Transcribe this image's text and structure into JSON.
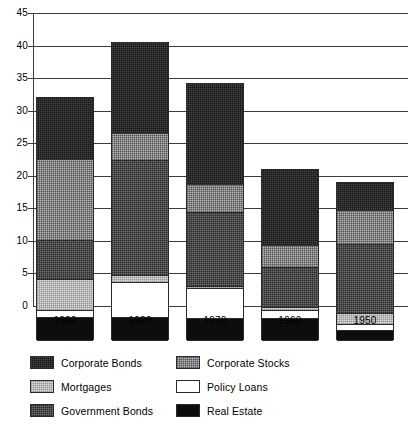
{
  "chart_data": {
    "type": "bar",
    "subtype": "stacked-bar",
    "title": "",
    "xlabel": "",
    "ylabel": "",
    "categories": [
      "1990",
      "1980",
      "1970",
      "1960",
      "1950"
    ],
    "ylim": [
      0,
      45
    ],
    "yticks": [
      0,
      5,
      10,
      15,
      20,
      25,
      30,
      35,
      40,
      45
    ],
    "ytick_labels": [
      "0",
      "5",
      "10",
      "15",
      "20",
      "25",
      "30",
      "35",
      "40",
      "45"
    ],
    "grid": true,
    "grid_axis": "y",
    "legend_position": "bottom",
    "stack_order_bottom_to_top": [
      "Real Estate",
      "Policy Loans",
      "Mortgages",
      "Corporate Stocks",
      "Government Bonds",
      "Corporate Bonds"
    ],
    "series": [
      {
        "name": "Real Estate",
        "color": "#0d0d0d",
        "pattern": "solid-black",
        "values": [
          3.6,
          3.5,
          3.3,
          3.3,
          1.5
        ]
      },
      {
        "name": "Policy Loans",
        "color": "#ffffff",
        "pattern": "solid-white",
        "values": [
          1.0,
          5.4,
          4.7,
          1.3,
          0.9
        ]
      },
      {
        "name": "Mortgages",
        "color": "#d9d9d9",
        "pattern": "light-dither",
        "values": [
          4.7,
          0.0,
          0.2,
          0.4,
          1.7
        ]
      },
      {
        "name": "Corporate Stocks",
        "color": "#b6b6b6",
        "pattern": "medium-dither",
        "values": [
          0.0,
          0.0,
          0.0,
          0.0,
          0.0
        ]
      },
      {
        "name": "Government Bonds",
        "color": "#6e6e6e",
        "pattern": "dark-dither",
        "values": [
          6.1,
          18.6,
          11.4,
          6.2,
          10.7
        ]
      },
      {
        "name": "Corporate Bonds",
        "color": "#151515",
        "pattern": "near-black",
        "values": [
          12.4,
          4.2,
          4.4,
          1.9,
          5.2
        ]
      }
    ],
    "extra_series_note": "Mortgages band also appears above Government Bonds in each stack",
    "upper_mortgages": {
      "name": "Mortgages",
      "values": [
        0.0,
        4.3,
        4.4,
        1.8,
        5.2
      ]
    },
    "totals": [
      37.3,
      45.7,
      39.4,
      26.3,
      24.2
    ]
  },
  "bars": [
    {
      "label": "1990",
      "total": 37.3,
      "segments": [
        {
          "series": "Real Estate",
          "value": 3.6,
          "from": 0.0,
          "to": 3.6
        },
        {
          "series": "Policy Loans",
          "value": 1.0,
          "from": 3.6,
          "to": 4.6
        },
        {
          "series": "Mortgages",
          "value": 4.7,
          "from": 4.6,
          "to": 9.3
        },
        {
          "series": "Government Bonds",
          "value": 6.1,
          "from": 9.3,
          "to": 15.4
        },
        {
          "series": "Corporate Stocks",
          "value": 12.4,
          "from": 15.4,
          "to": 27.8
        },
        {
          "series": "Corporate Bonds",
          "value": 9.5,
          "from": 27.8,
          "to": 37.3
        }
      ]
    },
    {
      "label": "1980",
      "total": 45.7,
      "segments": [
        {
          "series": "Real Estate",
          "value": 3.5,
          "from": 0.0,
          "to": 3.5
        },
        {
          "series": "Policy Loans",
          "value": 5.4,
          "from": 3.5,
          "to": 8.9
        },
        {
          "series": "Mortgages",
          "value": 1.1,
          "from": 8.9,
          "to": 10.0
        },
        {
          "series": "Government Bonds",
          "value": 17.6,
          "from": 10.0,
          "to": 27.6
        },
        {
          "series": "Corporate Stocks",
          "value": 4.2,
          "from": 27.6,
          "to": 31.8
        },
        {
          "series": "Corporate Bonds",
          "value": 13.9,
          "from": 31.8,
          "to": 45.7
        }
      ]
    },
    {
      "label": "1970",
      "total": 39.4,
      "segments": [
        {
          "series": "Real Estate",
          "value": 3.3,
          "from": 0.0,
          "to": 3.3
        },
        {
          "series": "Policy Loans",
          "value": 4.7,
          "from": 3.3,
          "to": 8.0
        },
        {
          "series": "Mortgages",
          "value": 0.3,
          "from": 8.0,
          "to": 8.3
        },
        {
          "series": "Government Bonds",
          "value": 11.3,
          "from": 8.3,
          "to": 19.6
        },
        {
          "series": "Corporate Stocks",
          "value": 4.4,
          "from": 19.6,
          "to": 24.0
        },
        {
          "series": "Corporate Bonds",
          "value": 15.4,
          "from": 24.0,
          "to": 39.4
        }
      ]
    },
    {
      "label": "1960",
      "total": 26.3,
      "segments": [
        {
          "series": "Real Estate",
          "value": 3.3,
          "from": 0.0,
          "to": 3.3
        },
        {
          "series": "Policy Loans",
          "value": 1.3,
          "from": 3.3,
          "to": 4.6
        },
        {
          "series": "Mortgages",
          "value": 0.4,
          "from": 4.6,
          "to": 5.0
        },
        {
          "series": "Government Bonds",
          "value": 6.2,
          "from": 5.0,
          "to": 11.2
        },
        {
          "series": "Corporate Stocks",
          "value": 1.9,
          "from": 11.2,
          "to": 14.6
        },
        {
          "series": "Corporate Bonds",
          "value": 11.7,
          "from": 14.6,
          "to": 26.3
        }
      ]
    },
    {
      "label": "1950",
      "total": 24.2,
      "segments": [
        {
          "series": "Real Estate",
          "value": 1.5,
          "from": 0.0,
          "to": 1.5
        },
        {
          "series": "Policy Loans",
          "value": 0.9,
          "from": 1.5,
          "to": 2.4
        },
        {
          "series": "Mortgages",
          "value": 1.7,
          "from": 2.4,
          "to": 4.1
        },
        {
          "series": "Government Bonds",
          "value": 10.7,
          "from": 4.1,
          "to": 14.8
        },
        {
          "series": "Corporate Stocks",
          "value": 5.2,
          "from": 14.8,
          "to": 20.0
        },
        {
          "series": "Corporate Bonds",
          "value": 4.2,
          "from": 20.0,
          "to": 24.2
        }
      ]
    }
  ],
  "legend": {
    "items": [
      {
        "label": "Corporate Bonds",
        "swatch": "p-corporate-bonds",
        "col": 0,
        "row": 0
      },
      {
        "label": "Corporate Stocks",
        "swatch": "p-corporate-stocks",
        "col": 1,
        "row": 0
      },
      {
        "label": "Mortgages",
        "swatch": "p-mortgages",
        "col": 0,
        "row": 1
      },
      {
        "label": "Policy Loans",
        "swatch": "p-policy-loans",
        "col": 1,
        "row": 1
      },
      {
        "label": "Government Bonds",
        "swatch": "p-government-bonds",
        "col": 0,
        "row": 2
      },
      {
        "label": "Real Estate",
        "swatch": "p-real-estate",
        "col": 1,
        "row": 2
      }
    ]
  }
}
